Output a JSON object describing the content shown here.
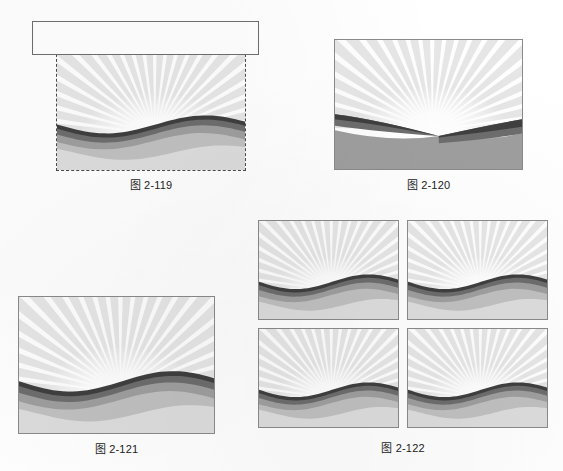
{
  "page": {
    "background_color": "#ffffff",
    "kind": "scanned-textbook-figure-page"
  },
  "figures": [
    {
      "id": "fig-2-119",
      "caption": "图 2-119",
      "description": "sunburst-landscape with white rectangle overlay and dashed selection marquee",
      "has_white_rectangle_overlay": true,
      "has_dashed_marquee": true,
      "variant": "wave"
    },
    {
      "id": "fig-2-120",
      "caption": "图 2-120",
      "description": "sunburst-landscape with bands pinched to a vanishing point near center",
      "has_white_rectangle_overlay": false,
      "has_dashed_marquee": false,
      "variant": "pinched"
    },
    {
      "id": "fig-2-121",
      "caption": "图 2-121",
      "description": "plain sunburst-landscape illustration",
      "has_white_rectangle_overlay": false,
      "has_dashed_marquee": false,
      "variant": "wave"
    },
    {
      "id": "fig-2-122",
      "caption": "图 2-122",
      "description": "two-by-two grid of four identical sunburst-landscape tiles",
      "tile_count": 4,
      "grid_rows": 2,
      "grid_cols": 2,
      "variant": "wave"
    }
  ],
  "artwork": {
    "sky_color": "#ffffff",
    "ray_color": "#e6e6e6",
    "ray_count": 24,
    "band_colors": [
      "#3f3f3f",
      "#6d6d6d",
      "#9e9e9e",
      "#c0c0c0",
      "#dcdcdc",
      "#ededed"
    ],
    "frame_border_color": "#8a8a8a",
    "marquee_border_color": "#4a4a4a",
    "overlay_rect_fill": "#ffffff",
    "overlay_rect_border": "#6e6e6e"
  }
}
